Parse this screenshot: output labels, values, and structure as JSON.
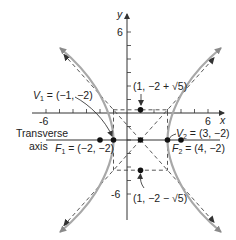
{
  "diagram": {
    "type": "hyperbola",
    "equation": "(x-1)^2/4 - (y+2)^2/5 = 1",
    "center": {
      "x": 1,
      "y": -2
    },
    "a": 2,
    "b_squared": 5,
    "axes": {
      "x_label": "x",
      "y_label": "y",
      "x_tick_labels": [
        "-6",
        "6"
      ],
      "y_tick_labels": [
        "6",
        "-6"
      ],
      "x_range": [
        -6,
        6
      ],
      "y_range": [
        -6,
        6
      ]
    },
    "labels": {
      "v1": "V",
      "v1_sub": "1",
      "v1_value": " = (−1, −2)",
      "v2": "V",
      "v2_sub": "2",
      "v2_value": " = (3, −2)",
      "f1": "F",
      "f1_sub": "1",
      "f1_value": " = (−2, −2)",
      "f2": "F",
      "f2_sub": "2",
      "f2_value": " = (4, −2)",
      "top_point_prefix": "(1, −2 + ",
      "top_point_root": "√5",
      "top_point_suffix": ")",
      "bottom_point_prefix": "(1, −2 − ",
      "bottom_point_root": "√5",
      "bottom_point_suffix": ")",
      "transverse_line1": "Transverse",
      "transverse_line2": "axis"
    },
    "points": [
      {
        "name": "V1",
        "x": -1,
        "y": -2
      },
      {
        "name": "V2",
        "x": 3,
        "y": -2
      },
      {
        "name": "F1",
        "x": -2,
        "y": -2
      },
      {
        "name": "F2",
        "x": 4,
        "y": -2
      },
      {
        "name": "center",
        "x": 1,
        "y": -2
      },
      {
        "name": "top",
        "x": 1,
        "y": 0.236
      },
      {
        "name": "bottom",
        "x": 1,
        "y": -4.236
      }
    ],
    "colors": {
      "curve": "#a8a8a8",
      "axis": "#333333",
      "dashed": "#444444",
      "point": "#111111"
    }
  }
}
